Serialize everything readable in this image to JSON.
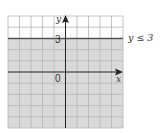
{
  "diagram": {
    "type": "inequality-graph",
    "inequality_label": "y ≤ 3",
    "boundary_value": 3,
    "boundary_label": "3",
    "origin_label": "0",
    "x_axis_label": "x",
    "y_axis_label": "y",
    "x_range": [
      -5,
      5
    ],
    "y_range": [
      -5,
      5
    ],
    "shaded_region": "below",
    "colors": {
      "shade": "#d9d9d9",
      "unshaded": "#ffffff",
      "grid": "#b5b5b5",
      "axis": "#222222",
      "boundary": "#555555"
    }
  }
}
